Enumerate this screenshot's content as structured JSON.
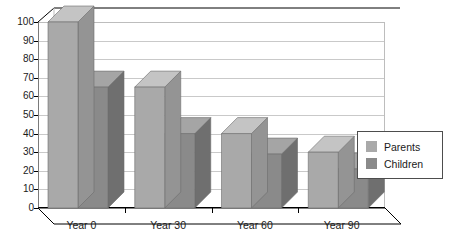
{
  "chart_data": {
    "type": "bar",
    "title": "",
    "subtitle": "",
    "xlabel": "",
    "ylabel": "",
    "categories": [
      "Year 0",
      "Year 30",
      "Year 60",
      "Year 90"
    ],
    "series": [
      {
        "name": "Parents",
        "values": [
          100,
          65,
          40,
          30
        ],
        "color": "#a9a9a9"
      },
      {
        "name": "Children",
        "values": [
          65,
          40,
          29,
          21
        ],
        "color": "#8a8a8a"
      }
    ],
    "ylim": [
      0,
      100
    ],
    "yticks": [
      0,
      10,
      20,
      30,
      40,
      50,
      60,
      70,
      80,
      90,
      100
    ],
    "ytick_labels": [
      "0",
      "10",
      "20",
      "30",
      "40",
      "50",
      "60",
      "70",
      "80",
      "90",
      "100"
    ],
    "grid": true,
    "grid_axis": "y",
    "legend_position": "right",
    "three_d": true,
    "annotations": []
  },
  "legend": {
    "entries": [
      {
        "label": "Parents",
        "color": "#a9a9a9"
      },
      {
        "label": "Children",
        "color": "#8a8a8a"
      }
    ]
  },
  "colors": {
    "parents_front": "#a9a9a9",
    "parents_top": "#c4c4c4",
    "parents_side": "#949494",
    "children_front": "#8a8a8a",
    "children_top": "#a5a5a5",
    "children_side": "#6f6f6f",
    "gridline": "#c9c9c9",
    "axis": "#000000",
    "floor_fill": "#ffffff",
    "legend_border": "#4d4d4d",
    "text": "#1a1a1a"
  }
}
